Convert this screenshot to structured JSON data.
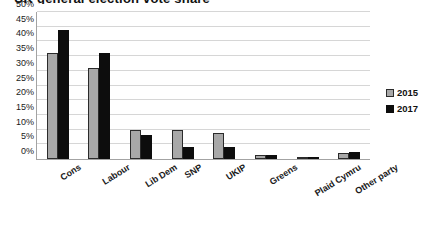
{
  "chart_data": {
    "type": "bar",
    "title": "UK general election vote share",
    "xlabel": "",
    "ylabel": "",
    "ylim": [
      0,
      50
    ],
    "ytick_labels": [
      "50%",
      "45%",
      "40%",
      "35%",
      "30%",
      "25%",
      "20%",
      "15%",
      "10%",
      "5%",
      "0%"
    ],
    "ytick_values": [
      50,
      45,
      40,
      35,
      30,
      25,
      20,
      15,
      10,
      5,
      0
    ],
    "ytick_suffix": "%",
    "grid": true,
    "legend_position": "right",
    "categories": [
      "Cons",
      "Labour",
      "Lib Dem",
      "SNP",
      "UKIP",
      "Greens",
      "Plaid Cymru",
      "Other party"
    ],
    "series": [
      {
        "name": "2015",
        "color": "#a8a8a8",
        "values": [
          36,
          31,
          10,
          10,
          9,
          1.5,
          0.5,
          2
        ]
      },
      {
        "name": "2017",
        "color": "#0d0d0d",
        "values": [
          44,
          36,
          8,
          4,
          4,
          1.5,
          0.5,
          2.5
        ]
      }
    ]
  },
  "legend": {
    "items": [
      {
        "label": "2015",
        "swatch": "legend-swatch-2015"
      },
      {
        "label": "2017",
        "swatch": "legend-swatch-2017"
      }
    ]
  }
}
